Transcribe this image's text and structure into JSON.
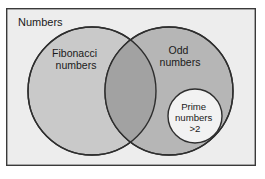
{
  "diagram": {
    "type": "venn",
    "title_visible": false,
    "universe": {
      "label": "Numbers",
      "shape": "rectangle",
      "fill": "#ededed",
      "stroke": "#3a3a3a",
      "x": 6,
      "y": 8,
      "width": 250,
      "height": 158
    },
    "sets": [
      {
        "id": "fibonacci",
        "label_line1": "Fibonacci",
        "label_line2": "numbers",
        "shape": "circle",
        "cx": 92,
        "cy": 91,
        "r": 64,
        "fill": "#c9c9c9",
        "stroke": "#2e2e2e",
        "label_x": 76,
        "label_y": 57
      },
      {
        "id": "odd",
        "label_line1": "Odd",
        "label_line2": "numbers",
        "shape": "circle",
        "cx": 169,
        "cy": 91,
        "r": 64,
        "fill": "#b6b6b6",
        "stroke": "#2e2e2e",
        "label_x": 180,
        "label_y": 54
      },
      {
        "id": "prime",
        "label_line1": "Prime",
        "label_line2": "numbers",
        "label_line3": ">2",
        "shape": "circle",
        "cx": 195,
        "cy": 116,
        "r": 27,
        "fill": "#f2f2f2",
        "stroke": "#2e2e2e",
        "label_x": 195,
        "label_y": 110
      }
    ],
    "intersection": {
      "id": "fibonacci-and-odd",
      "fill": "#a2a2a2",
      "stroke": "#2e2e2e"
    },
    "colors": {
      "page_background": "#ffffff",
      "universe_fill": "#ededed",
      "left_set_fill": "#c9c9c9",
      "right_set_fill": "#b6b6b6",
      "overlap_fill": "#a2a2a2",
      "inner_circle_fill": "#f2f2f2",
      "stroke": "#2e2e2e",
      "text": "#1a1a1a"
    }
  }
}
